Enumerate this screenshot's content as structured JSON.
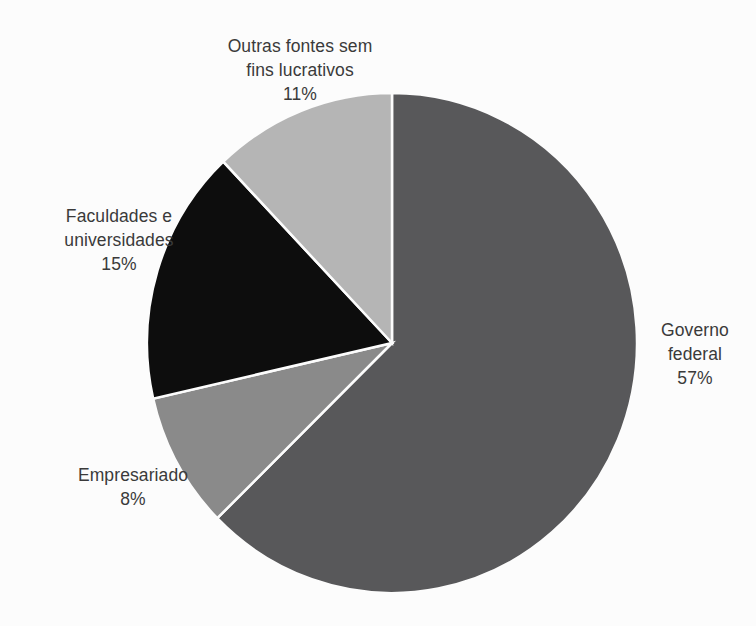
{
  "chart_data": {
    "type": "pie",
    "title": "",
    "subtitle": "",
    "xlabel": "",
    "ylabel": "",
    "legend_position": "none",
    "grid": false,
    "value_unit": "%",
    "start_angle_deg": 0,
    "direction": "clockwise",
    "categories": [
      "Governo federal",
      "Empresariado",
      "Faculdades e universidades",
      "Outras fontes sem fins lucrativos"
    ],
    "values": [
      57,
      8,
      15,
      11
    ],
    "colors": [
      "#58585a",
      "#8a8a8a",
      "#0d0d0d",
      "#b5b5b5"
    ],
    "slices": [
      {
        "name": "Governo federal",
        "value": 57,
        "value_label": "57%",
        "color": "#58585a",
        "label_lines": [
          "Governo",
          "federal",
          "57%"
        ]
      },
      {
        "name": "Empresariado",
        "value": 8,
        "value_label": "8%",
        "color": "#8a8a8a",
        "label_lines": [
          "Empresariado",
          "8%"
        ]
      },
      {
        "name": "Faculdades e universidades",
        "value": 15,
        "value_label": "15%",
        "color": "#0d0d0d",
        "label_lines": [
          "Faculdades e",
          "universidades",
          "15%"
        ]
      },
      {
        "name": "Outras fontes sem fins lucrativos",
        "value": 11,
        "value_label": "11%",
        "color": "#b5b5b5",
        "label_lines": [
          "Outras fontes sem",
          "fins lucrativos",
          "11%"
        ]
      }
    ]
  },
  "style": {
    "background_color": "#fcfcfc",
    "text_color": "#3a3a3a",
    "slice_border_color": "#fcfcfc"
  },
  "geometry": {
    "center_x": 392,
    "center_y": 343,
    "radius_x": 245,
    "radius_y": 250
  },
  "labels": {
    "outras": {
      "line1": "Outras fontes sem",
      "line2": "fins lucrativos",
      "line3": "11%"
    },
    "faculdades": {
      "line1": "Faculdades e",
      "line2": "universidades",
      "line3": "15%"
    },
    "empresariado": {
      "line1": "Empresariado",
      "line2": "8%"
    },
    "governo": {
      "line1": "Governo",
      "line2": "federal",
      "line3": "57%"
    }
  }
}
